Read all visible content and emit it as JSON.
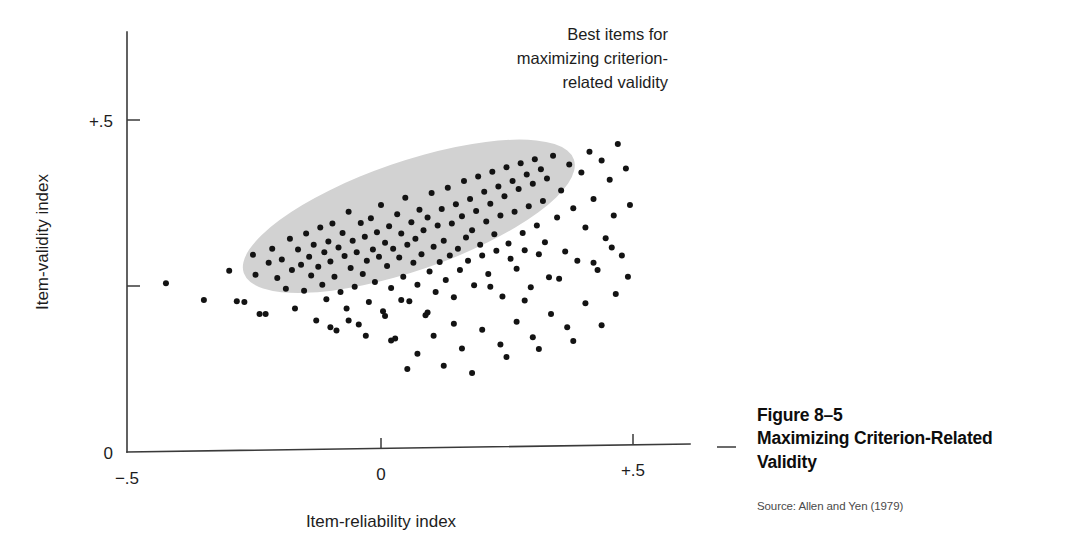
{
  "figure": {
    "number": "Figure 8–5",
    "title_line1": "Maximizing Criterion-Related",
    "title_line2": "Validity",
    "source": "Source: Allen and Yen (1979)"
  },
  "annotation": {
    "line1": "Best items for",
    "line2": "maximizing criterion-",
    "line3": "related validity"
  },
  "axes": {
    "x_label": "Item-reliability index",
    "y_label": "Item-validity index",
    "x_tick_left": "−.5",
    "x_tick_mid": "0",
    "x_tick_right": "+.5",
    "y_tick_top": "+.5",
    "y_tick_origin": "0"
  },
  "colors": {
    "ellipse_fill": "#d2d2d2",
    "point_fill": "#131313",
    "axis_stroke": "#3a3a3a",
    "text": "#1d1d1d",
    "caption_source": "#4a4a4a"
  },
  "chart_data": {
    "type": "scatter",
    "title": "Maximizing Criterion-Related Validity",
    "xlabel": "Item-reliability index",
    "ylabel": "Item-validity index",
    "xlim": [
      -0.5,
      0.62
    ],
    "ylim": [
      0.0,
      0.59
    ],
    "xticks": [
      -0.5,
      0.0,
      0.5
    ],
    "xticklabels": [
      "−.5",
      "0",
      "+.5"
    ],
    "yticks": [
      0.0,
      0.25,
      0.5
    ],
    "yticklabels": [
      "0",
      "",
      "+.5"
    ],
    "grid": false,
    "legend": null,
    "annotations": [
      {
        "text": "Best items for maximizing criterion-related validity",
        "x": 0.33,
        "y": 0.575,
        "align": "right"
      }
    ],
    "shapes": [
      {
        "type": "ellipse",
        "role": "best-items-region",
        "center_x": 0.055,
        "center_y": 0.355,
        "semi_major": 0.345,
        "semi_minor": 0.082,
        "angle_deg": -19,
        "fill": "#d2d2d2"
      }
    ],
    "series": [
      {
        "name": "Test items",
        "marker": "circle",
        "marker_size_px": 6,
        "color": "#131313",
        "n_points": 186,
        "points": [
          [
            -0.425,
            0.254
          ],
          [
            -0.35,
            0.229
          ],
          [
            -0.3,
            0.273
          ],
          [
            -0.285,
            0.227
          ],
          [
            -0.27,
            0.226
          ],
          [
            -0.253,
            0.297
          ],
          [
            -0.248,
            0.267
          ],
          [
            -0.24,
            0.208
          ],
          [
            -0.228,
            0.208
          ],
          [
            -0.222,
            0.285
          ],
          [
            -0.215,
            0.306
          ],
          [
            -0.205,
            0.262
          ],
          [
            -0.196,
            0.29
          ],
          [
            -0.188,
            0.246
          ],
          [
            -0.18,
            0.321
          ],
          [
            -0.176,
            0.274
          ],
          [
            -0.17,
            0.216
          ],
          [
            -0.164,
            0.305
          ],
          [
            -0.158,
            0.282
          ],
          [
            -0.152,
            0.243
          ],
          [
            -0.148,
            0.329
          ],
          [
            -0.142,
            0.294
          ],
          [
            -0.138,
            0.266
          ],
          [
            -0.133,
            0.312
          ],
          [
            -0.128,
            0.198
          ],
          [
            -0.124,
            0.279
          ],
          [
            -0.12,
            0.338
          ],
          [
            -0.116,
            0.252
          ],
          [
            -0.112,
            0.301
          ],
          [
            -0.108,
            0.23
          ],
          [
            -0.104,
            0.317
          ],
          [
            -0.1,
            0.287
          ],
          [
            -0.096,
            0.344
          ],
          [
            -0.092,
            0.264
          ],
          [
            -0.088,
            0.183
          ],
          [
            -0.084,
            0.308
          ],
          [
            -0.08,
            0.241
          ],
          [
            -0.076,
            0.33
          ],
          [
            -0.072,
            0.295
          ],
          [
            -0.068,
            0.216
          ],
          [
            -0.064,
            0.362
          ],
          [
            -0.06,
            0.277
          ],
          [
            -0.056,
            0.318
          ],
          [
            -0.052,
            0.249
          ],
          [
            -0.048,
            0.301
          ],
          [
            -0.044,
            0.192
          ],
          [
            -0.04,
            0.345
          ],
          [
            -0.036,
            0.268
          ],
          [
            -0.032,
            0.324
          ],
          [
            -0.028,
            0.288
          ],
          [
            -0.024,
            0.226
          ],
          [
            -0.02,
            0.352
          ],
          [
            -0.016,
            0.305
          ],
          [
            -0.012,
            0.256
          ],
          [
            -0.008,
            0.331
          ],
          [
            -0.004,
            0.294
          ],
          [
            0.0,
            0.372
          ],
          [
            0.004,
            0.212
          ],
          [
            0.008,
            0.315
          ],
          [
            0.012,
            0.28
          ],
          [
            0.016,
            0.34
          ],
          [
            0.02,
            0.247
          ],
          [
            0.024,
            0.306
          ],
          [
            0.028,
            0.171
          ],
          [
            0.032,
            0.358
          ],
          [
            0.036,
            0.293
          ],
          [
            0.04,
            0.329
          ],
          [
            0.044,
            0.264
          ],
          [
            0.048,
            0.383
          ],
          [
            0.052,
            0.312
          ],
          [
            0.056,
            0.227
          ],
          [
            0.06,
            0.346
          ],
          [
            0.064,
            0.285
          ],
          [
            0.068,
            0.321
          ],
          [
            0.072,
            0.252
          ],
          [
            0.076,
            0.365
          ],
          [
            0.08,
            0.298
          ],
          [
            0.084,
            0.334
          ],
          [
            0.088,
            0.206
          ],
          [
            0.092,
            0.353
          ],
          [
            0.096,
            0.272
          ],
          [
            0.1,
            0.39
          ],
          [
            0.104,
            0.309
          ],
          [
            0.108,
            0.241
          ],
          [
            0.112,
            0.341
          ],
          [
            0.116,
            0.286
          ],
          [
            0.12,
            0.366
          ],
          [
            0.124,
            0.318
          ],
          [
            0.128,
            0.259
          ],
          [
            0.132,
            0.398
          ],
          [
            0.136,
            0.296
          ],
          [
            0.14,
            0.344
          ],
          [
            0.144,
            0.193
          ],
          [
            0.148,
            0.373
          ],
          [
            0.152,
            0.306
          ],
          [
            0.156,
            0.274
          ],
          [
            0.16,
            0.355
          ],
          [
            0.164,
            0.408
          ],
          [
            0.168,
            0.323
          ],
          [
            0.172,
            0.288
          ],
          [
            0.176,
            0.381
          ],
          [
            0.18,
            0.334
          ],
          [
            0.184,
            0.251
          ],
          [
            0.188,
            0.363
          ],
          [
            0.192,
            0.415
          ],
          [
            0.196,
            0.312
          ],
          [
            0.2,
            0.296
          ],
          [
            0.204,
            0.392
          ],
          [
            0.208,
            0.347
          ],
          [
            0.212,
            0.268
          ],
          [
            0.216,
            0.374
          ],
          [
            0.22,
            0.422
          ],
          [
            0.224,
            0.328
          ],
          [
            0.228,
            0.303
          ],
          [
            0.232,
            0.4
          ],
          [
            0.236,
            0.356
          ],
          [
            0.24,
            0.234
          ],
          [
            0.244,
            0.385
          ],
          [
            0.248,
            0.429
          ],
          [
            0.252,
            0.314
          ],
          [
            0.256,
            0.291
          ],
          [
            0.26,
            0.408
          ],
          [
            0.264,
            0.362
          ],
          [
            0.268,
            0.276
          ],
          [
            0.272,
            0.396
          ],
          [
            0.276,
            0.435
          ],
          [
            0.28,
            0.33
          ],
          [
            0.284,
            0.304
          ],
          [
            0.288,
            0.418
          ],
          [
            0.292,
            0.37
          ],
          [
            0.296,
            0.248
          ],
          [
            0.3,
            0.404
          ],
          [
            0.304,
            0.441
          ],
          [
            0.308,
            0.341
          ],
          [
            0.312,
            0.298
          ],
          [
            0.316,
            0.426
          ],
          [
            0.32,
            0.378
          ],
          [
            0.324,
            0.316
          ],
          [
            0.328,
            0.412
          ],
          [
            0.332,
            0.263
          ],
          [
            0.34,
            0.446
          ],
          [
            0.348,
            0.353
          ],
          [
            0.356,
            0.394
          ],
          [
            0.364,
            0.302
          ],
          [
            0.372,
            0.433
          ],
          [
            0.38,
            0.367
          ],
          [
            0.388,
            0.288
          ],
          [
            0.396,
            0.421
          ],
          [
            0.404,
            0.338
          ],
          [
            0.412,
            0.452
          ],
          [
            0.42,
            0.381
          ],
          [
            0.428,
            0.274
          ],
          [
            0.436,
            0.439
          ],
          [
            0.444,
            0.322
          ],
          [
            0.452,
            0.41
          ],
          [
            0.46,
            0.356
          ],
          [
            0.468,
            0.464
          ],
          [
            0.476,
            0.296
          ],
          [
            0.484,
            0.427
          ],
          [
            0.492,
            0.372
          ],
          [
            0.16,
            0.156
          ],
          [
            0.072,
            0.148
          ],
          [
            0.104,
            0.175
          ],
          [
            0.02,
            0.168
          ],
          [
            -0.03,
            0.175
          ],
          [
            0.2,
            0.184
          ],
          [
            0.236,
            0.162
          ],
          [
            0.268,
            0.196
          ],
          [
            0.3,
            0.173
          ],
          [
            0.336,
            0.208
          ],
          [
            0.368,
            0.188
          ],
          [
            0.404,
            0.224
          ],
          [
            0.124,
            0.13
          ],
          [
            0.052,
            0.125
          ],
          [
            0.18,
            0.119
          ],
          [
            0.248,
            0.143
          ],
          [
            0.312,
            0.155
          ],
          [
            0.38,
            0.167
          ],
          [
            0.436,
            0.191
          ],
          [
            0.464,
            0.238
          ],
          [
            0.092,
            0.21
          ],
          [
            0.144,
            0.233
          ],
          [
            0.216,
            0.249
          ],
          [
            0.284,
            0.228
          ],
          [
            0.352,
            0.261
          ],
          [
            0.42,
            0.285
          ],
          [
            0.456,
            0.308
          ],
          [
            0.488,
            0.264
          ],
          [
            -0.064,
            0.198
          ],
          [
            -0.1,
            0.188
          ],
          [
            0.008,
            0.205
          ],
          [
            0.04,
            0.229
          ]
        ]
      }
    ]
  }
}
